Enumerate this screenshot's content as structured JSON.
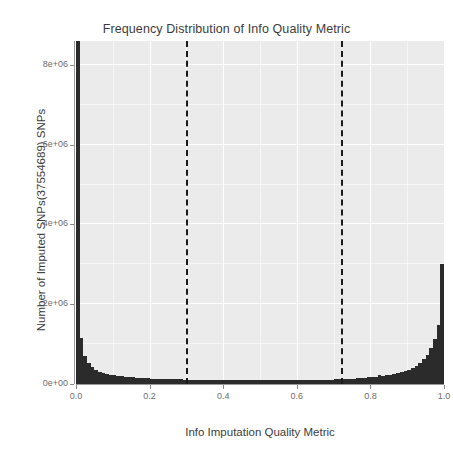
{
  "chart_data": {
    "type": "bar",
    "title": "Frequency Distribution of Info Quality Metric",
    "xlabel": "Info Imputation Quality Metric",
    "ylabel": "Number of Imputed SNPs(37554689) SNPs",
    "xlim": [
      0.0,
      1.0
    ],
    "ylim": [
      0,
      8600000
    ],
    "grid": true,
    "legend": "none",
    "xticks": [
      "0.0",
      "0.2",
      "0.4",
      "0.6",
      "0.8",
      "1.0"
    ],
    "xtick_values": [
      0.0,
      0.2,
      0.4,
      0.6,
      0.8,
      1.0
    ],
    "yticks": [
      "0e+00",
      "2e+06",
      "4e+06",
      "6e+06",
      "8e+06"
    ],
    "ytick_values": [
      0,
      2000000,
      4000000,
      6000000,
      8000000
    ],
    "annotations": [
      {
        "name": "threshold-low",
        "type": "vline",
        "x": 0.3,
        "style": "dashed",
        "color": "#1a1a1a"
      },
      {
        "name": "threshold-high",
        "type": "vline",
        "x": 0.72,
        "style": "dashed",
        "color": "#1a1a1a"
      }
    ],
    "bin_width": 0.01,
    "categories": [
      0.005,
      0.015,
      0.025,
      0.035,
      0.045,
      0.055,
      0.065,
      0.075,
      0.085,
      0.095,
      0.105,
      0.115,
      0.125,
      0.135,
      0.145,
      0.155,
      0.165,
      0.175,
      0.185,
      0.195,
      0.205,
      0.215,
      0.225,
      0.235,
      0.245,
      0.255,
      0.265,
      0.275,
      0.285,
      0.295,
      0.305,
      0.315,
      0.325,
      0.335,
      0.345,
      0.355,
      0.365,
      0.375,
      0.385,
      0.395,
      0.405,
      0.415,
      0.425,
      0.435,
      0.445,
      0.455,
      0.465,
      0.475,
      0.485,
      0.495,
      0.505,
      0.515,
      0.525,
      0.535,
      0.545,
      0.555,
      0.565,
      0.575,
      0.585,
      0.595,
      0.605,
      0.615,
      0.625,
      0.635,
      0.645,
      0.655,
      0.665,
      0.675,
      0.685,
      0.695,
      0.705,
      0.715,
      0.725,
      0.735,
      0.745,
      0.755,
      0.765,
      0.775,
      0.785,
      0.795,
      0.805,
      0.815,
      0.825,
      0.835,
      0.845,
      0.855,
      0.865,
      0.875,
      0.885,
      0.895,
      0.905,
      0.915,
      0.925,
      0.935,
      0.945,
      0.955,
      0.965,
      0.975,
      0.985,
      0.995
    ],
    "values": [
      8600000,
      1150000,
      700000,
      530000,
      430000,
      360000,
      310000,
      275000,
      250000,
      230000,
      215000,
      200000,
      190000,
      180000,
      172000,
      165000,
      158000,
      152000,
      147000,
      142000,
      138000,
      134000,
      130000,
      127000,
      124000,
      121000,
      119000,
      117000,
      115000,
      113000,
      111000,
      110000,
      108000,
      107000,
      106000,
      105000,
      104000,
      103000,
      102000,
      101000,
      100000,
      100000,
      99000,
      99000,
      98000,
      98000,
      97000,
      97000,
      97000,
      96000,
      96000,
      96000,
      96000,
      96000,
      96000,
      96000,
      97000,
      97000,
      97000,
      98000,
      98000,
      99000,
      100000,
      101000,
      102000,
      103000,
      105000,
      107000,
      109000,
      112000,
      115000,
      118000,
      122000,
      126000,
      131000,
      136000,
      142000,
      149000,
      157000,
      166000,
      176000,
      188000,
      230000,
      205000,
      215000,
      230000,
      248000,
      268000,
      292000,
      320000,
      355000,
      400000,
      455000,
      525000,
      615000,
      735000,
      900000,
      1130000,
      1480000,
      3000000
    ]
  }
}
